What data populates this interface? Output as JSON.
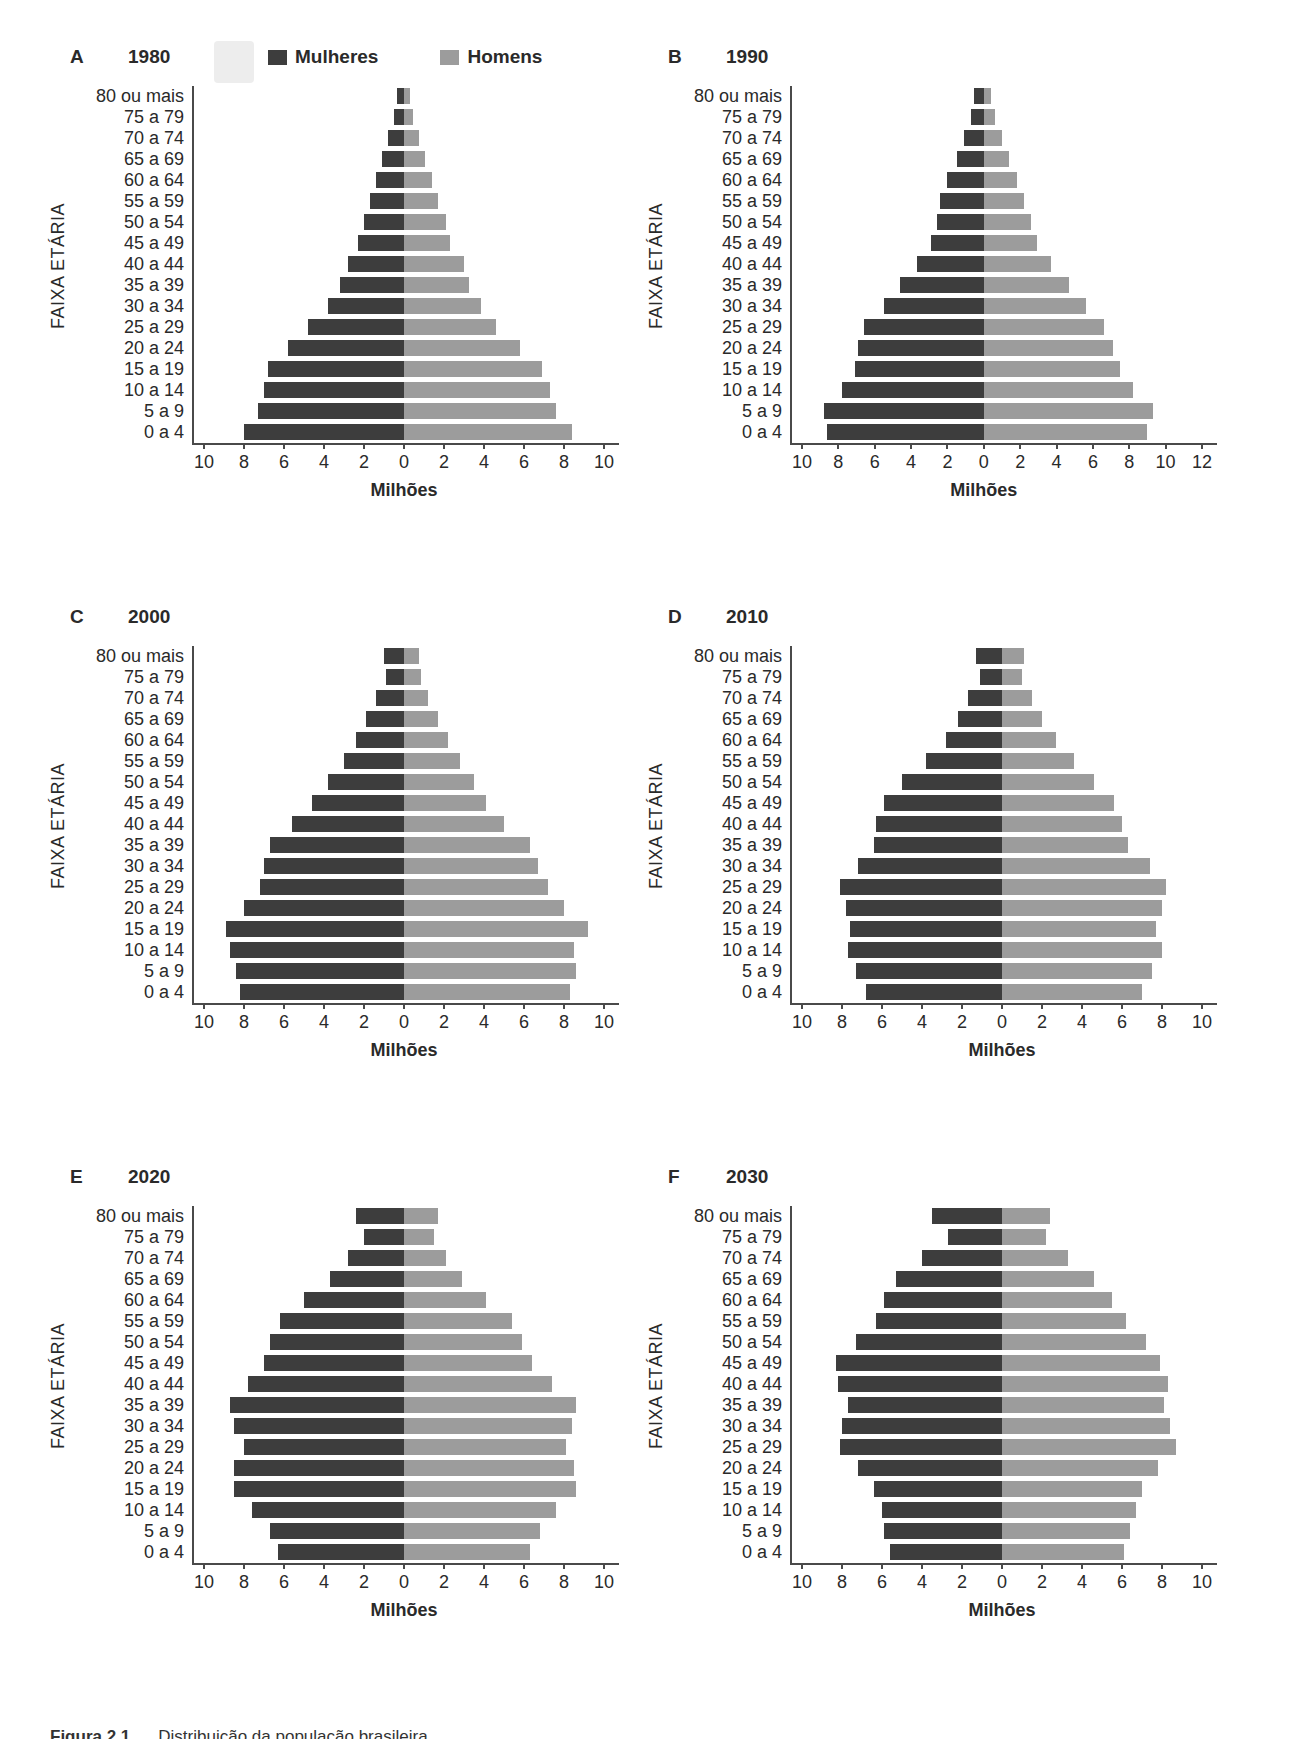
{
  "figure": {
    "caption_bold": "Figura 2.1",
    "caption_text": "Distribuição da população brasileira",
    "y_axis_label": "FAIXA ETÁRIA",
    "x_axis_label": "Milhões"
  },
  "legend": {
    "female_label": "Mulheres",
    "male_label": "Homens"
  },
  "colors": {
    "female": "#3d3d3d",
    "male": "#9c9c9c",
    "axis": "#4a4a4a",
    "text": "#2a2a2a"
  },
  "age_groups": [
    "80 ou mais",
    "75 a 79",
    "70 a 74",
    "65 a 69",
    "60 a 64",
    "55 a 59",
    "50 a 54",
    "45 a 49",
    "40 a 44",
    "35 a 39",
    "30 a 34",
    "25 a 29",
    "20 a 24",
    "15 a 19",
    "10 a 14",
    "5 a 9",
    "0 a 4"
  ],
  "chart_data": [
    {
      "type": "bar",
      "subtype": "population-pyramid",
      "id": "A",
      "year": "1980",
      "has_legend": true,
      "xlabel": "Milhões",
      "ylabel": "FAIXA ETÁRIA",
      "left_max": 10,
      "right_max": 10,
      "xticks": [
        10,
        8,
        6,
        4,
        2,
        0,
        2,
        4,
        6,
        8,
        10
      ],
      "series": [
        {
          "name": "Mulheres",
          "side": "left",
          "values": [
            0.35,
            0.5,
            0.8,
            1.1,
            1.4,
            1.7,
            2.0,
            2.3,
            2.8,
            3.2,
            3.8,
            4.8,
            5.8,
            6.8,
            7.0,
            7.3,
            8.0
          ]
        },
        {
          "name": "Homens",
          "side": "right",
          "values": [
            0.3,
            0.45,
            0.75,
            1.05,
            1.4,
            1.7,
            2.1,
            2.3,
            3.0,
            3.25,
            3.85,
            4.6,
            5.8,
            6.9,
            7.3,
            7.6,
            8.4
          ]
        }
      ]
    },
    {
      "type": "bar",
      "subtype": "population-pyramid",
      "id": "B",
      "year": "1990",
      "has_legend": false,
      "xlabel": "Milhões",
      "ylabel": "FAIXA ETÁRIA",
      "left_max": 10,
      "right_max": 12,
      "xticks": [
        10,
        8,
        6,
        4,
        2,
        0,
        2,
        4,
        6,
        8,
        10,
        12
      ],
      "series": [
        {
          "name": "Mulheres",
          "side": "left",
          "values": [
            0.55,
            0.7,
            1.1,
            1.5,
            2.0,
            2.4,
            2.6,
            2.9,
            3.7,
            4.6,
            5.5,
            6.6,
            6.9,
            7.1,
            7.8,
            8.8,
            8.6
          ]
        },
        {
          "name": "Homens",
          "side": "right",
          "values": [
            0.4,
            0.6,
            1.0,
            1.4,
            1.8,
            2.2,
            2.6,
            2.9,
            3.7,
            4.7,
            5.6,
            6.6,
            7.1,
            7.5,
            8.2,
            9.3,
            9.0
          ]
        }
      ]
    },
    {
      "type": "bar",
      "subtype": "population-pyramid",
      "id": "C",
      "year": "2000",
      "has_legend": false,
      "xlabel": "Milhões",
      "ylabel": "FAIXA ETÁRIA",
      "left_max": 10,
      "right_max": 10,
      "xticks": [
        10,
        8,
        6,
        4,
        2,
        0,
        2,
        4,
        6,
        8,
        10
      ],
      "series": [
        {
          "name": "Mulheres",
          "side": "left",
          "values": [
            1.0,
            0.9,
            1.4,
            1.9,
            2.4,
            3.0,
            3.8,
            4.6,
            5.6,
            6.7,
            7.0,
            7.2,
            8.0,
            8.9,
            8.7,
            8.4,
            8.2
          ]
        },
        {
          "name": "Homens",
          "side": "right",
          "values": [
            0.75,
            0.85,
            1.2,
            1.7,
            2.2,
            2.8,
            3.5,
            4.1,
            5.0,
            6.3,
            6.7,
            7.2,
            8.0,
            9.2,
            8.5,
            8.6,
            8.3
          ]
        }
      ]
    },
    {
      "type": "bar",
      "subtype": "population-pyramid",
      "id": "D",
      "year": "2010",
      "has_legend": false,
      "xlabel": "Milhões",
      "ylabel": "FAIXA ETÁRIA",
      "left_max": 10,
      "right_max": 10,
      "xticks": [
        10,
        8,
        6,
        4,
        2,
        0,
        2,
        4,
        6,
        8,
        10
      ],
      "series": [
        {
          "name": "Mulheres",
          "side": "left",
          "values": [
            1.3,
            1.1,
            1.7,
            2.2,
            2.8,
            3.8,
            5.0,
            5.9,
            6.3,
            6.4,
            7.2,
            8.1,
            7.8,
            7.6,
            7.7,
            7.3,
            6.8
          ]
        },
        {
          "name": "Homens",
          "side": "right",
          "values": [
            1.1,
            1.0,
            1.5,
            2.0,
            2.7,
            3.6,
            4.6,
            5.6,
            6.0,
            6.3,
            7.4,
            8.2,
            8.0,
            7.7,
            8.0,
            7.5,
            7.0
          ]
        }
      ]
    },
    {
      "type": "bar",
      "subtype": "population-pyramid",
      "id": "E",
      "year": "2020",
      "has_legend": false,
      "xlabel": "Milhões",
      "ylabel": "FAIXA ETÁRIA",
      "left_max": 10,
      "right_max": 10,
      "xticks": [
        10,
        8,
        6,
        4,
        2,
        0,
        2,
        4,
        6,
        8,
        10
      ],
      "series": [
        {
          "name": "Mulheres",
          "side": "left",
          "values": [
            2.4,
            2.0,
            2.8,
            3.7,
            5.0,
            6.2,
            6.7,
            7.0,
            7.8,
            8.7,
            8.5,
            8.0,
            8.5,
            8.5,
            7.6,
            6.7,
            6.3
          ]
        },
        {
          "name": "Homens",
          "side": "right",
          "values": [
            1.7,
            1.5,
            2.1,
            2.9,
            4.1,
            5.4,
            5.9,
            6.4,
            7.4,
            8.6,
            8.4,
            8.1,
            8.5,
            8.6,
            7.6,
            6.8,
            6.3
          ]
        }
      ]
    },
    {
      "type": "bar",
      "subtype": "population-pyramid",
      "id": "F",
      "year": "2030",
      "has_legend": false,
      "xlabel": "Milhões",
      "ylabel": "FAIXA ETÁRIA",
      "left_max": 10,
      "right_max": 10,
      "xticks": [
        10,
        8,
        6,
        4,
        2,
        0,
        2,
        4,
        6,
        8,
        10
      ],
      "series": [
        {
          "name": "Mulheres",
          "side": "left",
          "values": [
            3.5,
            2.7,
            4.0,
            5.3,
            5.9,
            6.3,
            7.3,
            8.3,
            8.2,
            7.7,
            8.0,
            8.1,
            7.2,
            6.4,
            6.0,
            5.9,
            5.6
          ]
        },
        {
          "name": "Homens",
          "side": "right",
          "values": [
            2.4,
            2.2,
            3.3,
            4.6,
            5.5,
            6.2,
            7.2,
            7.9,
            8.3,
            8.1,
            8.4,
            8.7,
            7.8,
            7.0,
            6.7,
            6.4,
            6.1
          ]
        }
      ]
    }
  ]
}
